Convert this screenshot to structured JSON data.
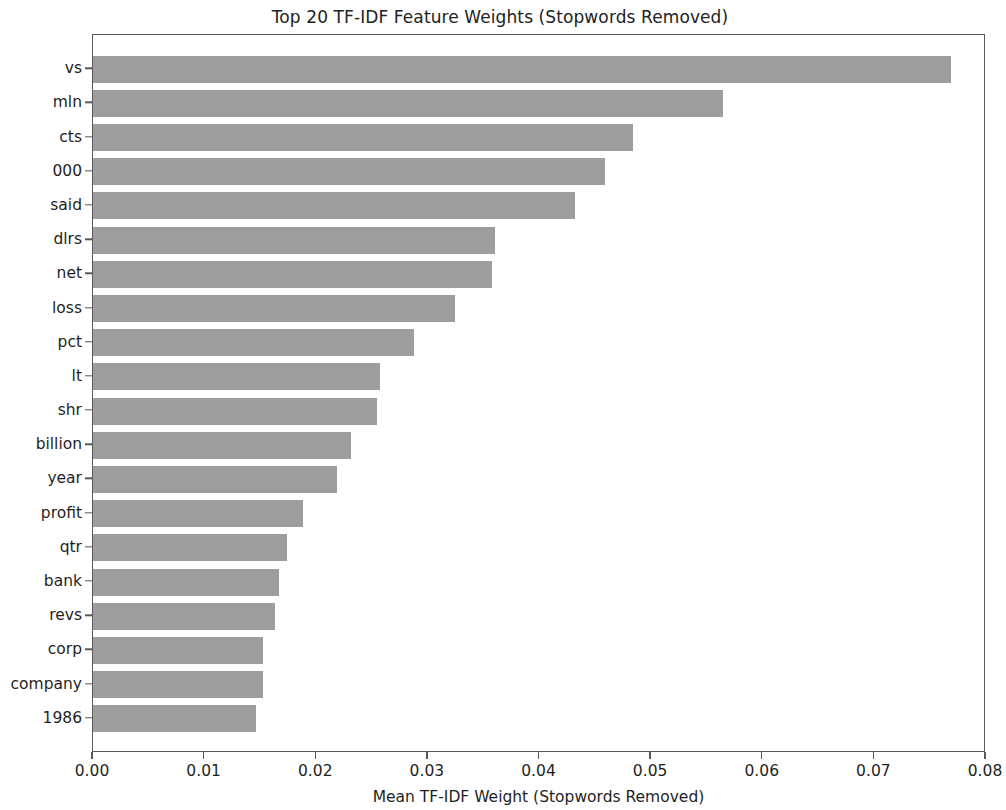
{
  "figure": {
    "title": "Top 20 TF-IDF Feature Weights (Stopwords Removed)",
    "xlabel": "Mean TF-IDF Weight (Stopwords Removed)",
    "ylabel": "",
    "background_color": "#ffffff",
    "bar_color": "#9e9e9e",
    "axis_color": "#5a5a5a",
    "text_color": "#1f1f1f"
  },
  "axes": {
    "x_ticks": [
      "0.00",
      "0.01",
      "0.02",
      "0.03",
      "0.04",
      "0.05",
      "0.06",
      "0.07",
      "0.08"
    ],
    "x_tick_values": [
      0.0,
      0.01,
      0.02,
      0.03,
      0.04,
      0.05,
      0.06,
      0.07,
      0.08
    ],
    "grid": "off"
  },
  "chart_data": {
    "type": "bar",
    "orientation": "horizontal",
    "title": "Top 20 TF-IDF Feature Weights (Stopwords Removed)",
    "xlabel": "Mean TF-IDF Weight (Stopwords Removed)",
    "ylabel": "",
    "xlim": [
      0.0,
      0.08
    ],
    "grid": false,
    "legend": null,
    "categories": [
      "vs",
      "mln",
      "cts",
      "000",
      "said",
      "dlrs",
      "net",
      "loss",
      "pct",
      "lt",
      "shr",
      "billion",
      "year",
      "profit",
      "qtr",
      "bank",
      "revs",
      "corp",
      "company",
      "1986"
    ],
    "values": [
      0.0769,
      0.0564,
      0.0484,
      0.0459,
      0.0432,
      0.036,
      0.0357,
      0.0324,
      0.0288,
      0.0257,
      0.0254,
      0.0231,
      0.0219,
      0.0188,
      0.0174,
      0.0167,
      0.0163,
      0.0152,
      0.0152,
      0.0146
    ]
  }
}
